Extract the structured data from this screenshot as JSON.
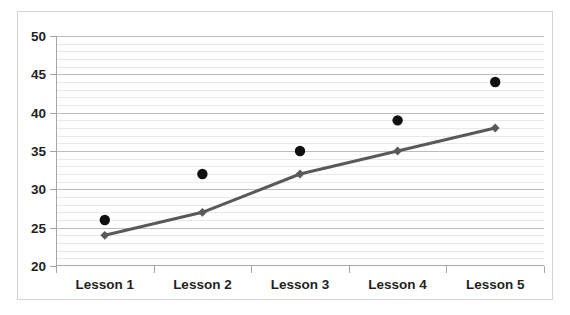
{
  "chart_data": {
    "type": "line",
    "title": "",
    "xlabel": "",
    "ylabel": "",
    "categories": [
      "Lesson 1",
      "Lesson 2",
      "Lesson 3",
      "Lesson 4",
      "Lesson 5"
    ],
    "series": [
      {
        "name": "scatter-series",
        "type": "scatter",
        "marker": "circle",
        "color": "#101010",
        "values": [
          26,
          32,
          35,
          39,
          44
        ]
      },
      {
        "name": "line-series",
        "type": "line",
        "marker": "diamond",
        "color": "#595959",
        "values": [
          24,
          27,
          32,
          35,
          38
        ]
      }
    ],
    "ylim": [
      20,
      50
    ],
    "y_major_ticks": [
      20,
      25,
      30,
      35,
      40,
      45,
      50
    ],
    "y_tick_labels": [
      "20",
      "25",
      "30",
      "35",
      "40",
      "45",
      "50"
    ],
    "y_minor_step": 1,
    "grid": true,
    "legend": "none"
  },
  "colors": {
    "gridline_minor": "#e9e9e9",
    "gridline_major": "#bdbdbd",
    "axis": "#a6a6a6",
    "frame_border": "#d4d4d4",
    "plot_background": "#ffffff",
    "scatter_marker": "#101010",
    "line_series": "#595959"
  }
}
